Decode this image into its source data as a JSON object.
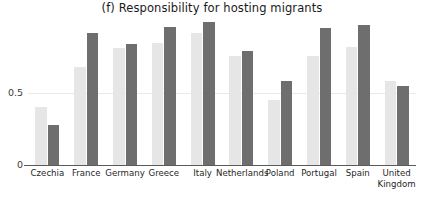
{
  "chart_data": {
    "type": "bar",
    "title": "(f) Responsibility for hosting migrants",
    "xlabel": "",
    "ylabel": "",
    "ylim": [
      0,
      1.0
    ],
    "yticks": [
      0,
      0.5
    ],
    "ytick_labels": [
      "0",
      "0.5"
    ],
    "grid": true,
    "legend": "none",
    "categories": [
      "Czechia",
      "France",
      "Germany",
      "Greece",
      "Italy",
      "Netherlands",
      "Poland",
      "Portugal",
      "Spain",
      "United\nKingdom"
    ],
    "series": [
      {
        "name": "light",
        "color": "#e6e6e6",
        "values": [
          0.4,
          0.68,
          0.81,
          0.85,
          0.92,
          0.76,
          0.45,
          0.76,
          0.82,
          0.58
        ]
      },
      {
        "name": "dark",
        "color": "#6e6e6e",
        "values": [
          0.28,
          0.92,
          0.84,
          0.96,
          0.99,
          0.79,
          0.58,
          0.95,
          0.97,
          0.55
        ]
      }
    ]
  }
}
